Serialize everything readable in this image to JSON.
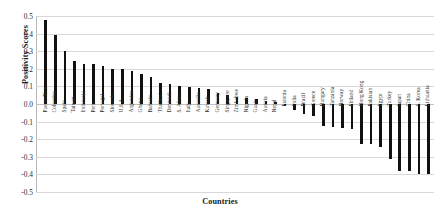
{
  "chart_data": {
    "type": "bar",
    "title": "",
    "xlabel": "Countries",
    "ylabel": "Positivity Scores",
    "ylim": [
      -0.5,
      0.5
    ],
    "yticks": [
      0.5,
      0.4,
      0.3,
      0.2,
      0.1,
      0.0,
      -0.1,
      -0.2,
      -0.3,
      -0.4,
      -0.5
    ],
    "ytick_labels": [
      "0.5",
      "0.4",
      "0.3",
      "0.2",
      "0.1",
      "0.0",
      "-0.1",
      "-0.2",
      "-0.3",
      "-0.4",
      "-0.5"
    ],
    "grid": true,
    "legend": false,
    "bar_color": "#111111",
    "categories": [
      "Puerto Rico",
      "Colombia",
      "Spain",
      "Taiwan",
      "Indonesia",
      "Peru",
      "Portugal",
      "Slovenia",
      "U.S.A.",
      "Argentina",
      "Ghana",
      "Bahrain",
      "Thailand",
      "Denmark",
      "S. Africa",
      "Italy",
      "Australia",
      "Kuwait",
      "Germany",
      "Singapore",
      "Zimbabwe",
      "Nigeria",
      "Guam",
      "Austria",
      "Nepal",
      "Estonia",
      "India",
      "Brazil",
      "Greece",
      "Hungary",
      "Tanzania",
      "Norway",
      "Finland",
      "Hong Kong",
      "Pakistan",
      "Egypt",
      "Turkey",
      "Japan",
      "China",
      "S. Korea",
      "Lithuania"
    ],
    "values": [
      0.48,
      0.39,
      0.3,
      0.245,
      0.225,
      0.225,
      0.215,
      0.198,
      0.197,
      0.19,
      0.172,
      0.152,
      0.122,
      0.112,
      0.105,
      0.096,
      0.09,
      0.086,
      0.06,
      0.05,
      0.042,
      0.035,
      0.028,
      0.018,
      0.009,
      -0.012,
      -0.035,
      -0.055,
      -0.07,
      -0.125,
      -0.13,
      -0.135,
      -0.142,
      -0.225,
      -0.228,
      -0.245,
      -0.315,
      -0.378,
      -0.38,
      -0.395,
      -0.398
    ]
  }
}
